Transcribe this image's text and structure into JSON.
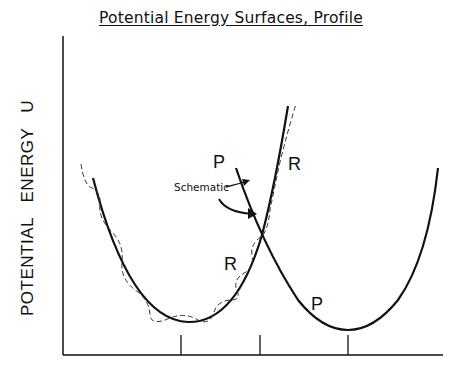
{
  "title": "Potential Energy Surfaces, Profile",
  "y_axis_label": "POTENTIAL  ENERGY  U",
  "curves": [
    {
      "name": "reactant-surface",
      "label": "R",
      "style": "solid"
    },
    {
      "name": "reactant-dashed-surface",
      "label": "R",
      "style": "dashed"
    },
    {
      "name": "product-surface",
      "label": "P",
      "style": "solid"
    }
  ],
  "labels": {
    "p_upper": "P",
    "r_upper": "R",
    "r_lower": "R",
    "p_lower": "P",
    "schematic": "Schematic"
  },
  "x_ticks": 3,
  "colors": {
    "line": "#111111",
    "background": "#ffffff"
  }
}
